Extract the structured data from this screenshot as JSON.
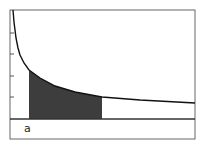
{
  "chart_data": {
    "type": "area",
    "title": "",
    "xlabel": "",
    "ylabel": "",
    "annotations": [
      {
        "text": "a",
        "position": "below x-axis at left edge of shaded region"
      }
    ],
    "x_tick_labels": [
      "a"
    ],
    "y_ticks_count": 4,
    "grid": false,
    "legend": null,
    "series": [
      {
        "name": "decreasing curve",
        "points_px": [
          [
            13,
            10
          ],
          [
            14,
            22
          ],
          [
            16,
            38
          ],
          [
            18,
            48
          ],
          [
            20,
            55
          ],
          [
            24,
            63
          ],
          [
            29,
            70
          ],
          [
            40,
            78
          ],
          [
            55,
            86
          ],
          [
            75,
            92
          ],
          [
            102,
            97
          ],
          [
            140,
            100
          ],
          [
            195,
            103
          ]
        ]
      }
    ],
    "shaded_region": {
      "x_start_px": 29,
      "x_end_px": 102,
      "color": "#3d3d3d",
      "description": "area under curve from a to b"
    },
    "colors": {
      "frame": "#555555",
      "curve": "#111111",
      "shade": "#3d3d3d",
      "axis": "#333333"
    }
  },
  "labels": {
    "a": "a"
  }
}
